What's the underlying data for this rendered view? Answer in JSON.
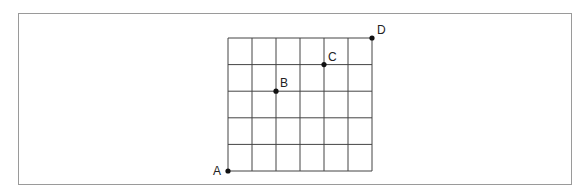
{
  "diagram": {
    "type": "grid",
    "columns": 6,
    "rows": 5,
    "grid_color": "#444444",
    "frame_color": "#9a9a9a",
    "points": [
      {
        "label": "A",
        "col": 0,
        "row": 0
      },
      {
        "label": "B",
        "col": 2,
        "row": 3
      },
      {
        "label": "C",
        "col": 4,
        "row": 4
      },
      {
        "label": "D",
        "col": 6,
        "row": 5
      }
    ]
  }
}
